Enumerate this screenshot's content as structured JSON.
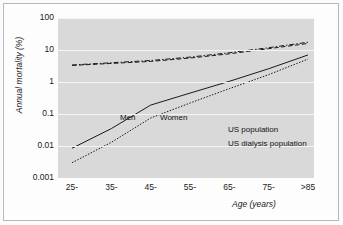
{
  "chart_data": {
    "type": "line",
    "title": "",
    "xlabel": "Age (years)",
    "ylabel": "Annual mortality (%)",
    "yscale": "log",
    "ylim": [
      0.001,
      100
    ],
    "yticks": [
      "100",
      "10",
      "1",
      "0.1",
      "0.01",
      "0.001"
    ],
    "ytick_values": [
      100,
      10,
      1,
      0.1,
      0.01,
      0.001
    ],
    "categories": [
      "25-",
      "35-",
      "45-",
      "55-",
      "65-",
      "75-",
      ">85"
    ],
    "grid": true,
    "legend_position": "inside-lower-right",
    "series": [
      {
        "name": "US population",
        "sex": "Men",
        "style": "solid",
        "values": [
          0.0085,
          0.035,
          0.19,
          0.45,
          1.05,
          2.6,
          7.0
        ]
      },
      {
        "name": "US population",
        "sex": "Women",
        "style": "dotted",
        "values": [
          0.003,
          0.013,
          0.075,
          0.22,
          0.62,
          1.7,
          5.2
        ]
      },
      {
        "name": "US dialysis population",
        "sex": "Men",
        "style": "dashed",
        "values": [
          3.3,
          3.8,
          4.4,
          5.6,
          7.6,
          11.0,
          16.0
        ]
      },
      {
        "name": "US dialysis population",
        "sex": "Women",
        "style": "dashdot",
        "values": [
          3.4,
          4.0,
          4.7,
          6.0,
          8.2,
          11.8,
          17.5
        ]
      }
    ]
  },
  "legend": {
    "col_men": "Men",
    "col_women": "Women",
    "rows": [
      {
        "label": "US population"
      },
      {
        "label": "US dialysis population"
      }
    ]
  },
  "colors": {
    "panel_background": "#d9d9d9",
    "gridline": "#f4f4f4",
    "line": "#1a1a1a",
    "frame_border": "#b9b9b9",
    "figure_background": "#fbfbfb"
  }
}
